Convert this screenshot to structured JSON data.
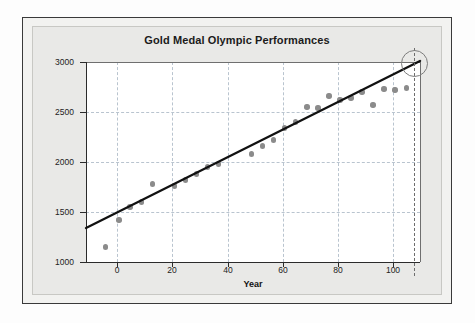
{
  "chart_data": {
    "type": "scatter",
    "title": "Gold Medal Olympic Performances",
    "xlabel": "Year",
    "ylabel": "Discus Throw",
    "xlim": [
      -11,
      110
    ],
    "ylim": [
      1000,
      3000
    ],
    "xticks": [
      0,
      20,
      40,
      60,
      80,
      100
    ],
    "yticks": [
      1000,
      1500,
      2000,
      2500,
      3000
    ],
    "grid": true,
    "legend": "none",
    "series": [
      {
        "name": "Gold medal discus throw distance",
        "marker": "filled-circle",
        "color": "#8b8b8b",
        "points": [
          {
            "x": -4,
            "y": 1150
          },
          {
            "x": 1,
            "y": 1420
          },
          {
            "x": 5,
            "y": 1550
          },
          {
            "x": 9,
            "y": 1600
          },
          {
            "x": 13,
            "y": 1780
          },
          {
            "x": 21,
            "y": 1760
          },
          {
            "x": 25,
            "y": 1820
          },
          {
            "x": 29,
            "y": 1880
          },
          {
            "x": 33,
            "y": 1950
          },
          {
            "x": 37,
            "y": 1980
          },
          {
            "x": 49,
            "y": 2080
          },
          {
            "x": 53,
            "y": 2160
          },
          {
            "x": 57,
            "y": 2220
          },
          {
            "x": 61,
            "y": 2340
          },
          {
            "x": 65,
            "y": 2400
          },
          {
            "x": 69,
            "y": 2550
          },
          {
            "x": 73,
            "y": 2540
          },
          {
            "x": 77,
            "y": 2660
          },
          {
            "x": 81,
            "y": 2620
          },
          {
            "x": 85,
            "y": 2640
          },
          {
            "x": 89,
            "y": 2700
          },
          {
            "x": 93,
            "y": 2570
          },
          {
            "x": 97,
            "y": 2730
          },
          {
            "x": 101,
            "y": 2720
          },
          {
            "x": 105,
            "y": 2740
          }
        ]
      }
    ],
    "trendline": {
      "name": "least-squares regression line",
      "color": "#111111",
      "x_start": -11,
      "y_start": 1340,
      "x_end": 110,
      "y_end": 3010
    },
    "annotations": [
      {
        "type": "vertical-dashed-line",
        "name": "prediction-year-marker",
        "x": 108
      },
      {
        "type": "circle-highlight",
        "name": "extrapolated-prediction-highlight",
        "x": 108,
        "y": 2985,
        "radius_px": 13.5
      }
    ]
  }
}
